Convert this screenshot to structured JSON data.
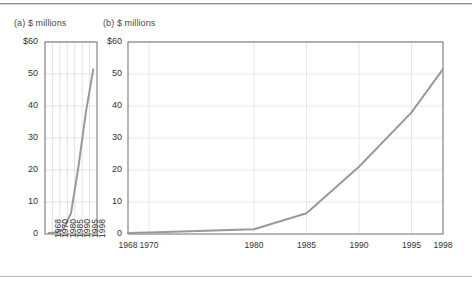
{
  "rules": {
    "top_label": "top-divider",
    "bottom_label": "bottom-divider"
  },
  "panels": [
    {
      "id": "a",
      "caption": "(a) $ millions"
    },
    {
      "id": "b",
      "caption": "(b) $ millions"
    }
  ],
  "chart_data": [
    {
      "type": "line",
      "title": "(a) $ millions",
      "xlabel": "",
      "ylabel": "$ millions",
      "x_scale": "categorical",
      "categories": [
        "1968",
        "1970",
        "1980",
        "1985",
        "1990",
        "1995",
        "1998"
      ],
      "values": [
        0.3,
        0.5,
        1.5,
        6.5,
        21,
        38,
        51.5
      ],
      "ytick_labels": [
        "$60",
        "50",
        "40",
        "30",
        "20",
        "10",
        "0"
      ],
      "yticks": [
        60,
        50,
        40,
        30,
        20,
        10,
        0
      ],
      "ylim": [
        0,
        60
      ],
      "grid": "both",
      "legend": "none",
      "series_color": "#999999"
    },
    {
      "type": "line",
      "title": "(b) $ millions",
      "xlabel": "",
      "ylabel": "$ millions",
      "x_scale": "linear",
      "x": [
        1968,
        1970,
        1980,
        1985,
        1990,
        1995,
        1998
      ],
      "xtick_labels": [
        "1968",
        "1970",
        "1980",
        "1985",
        "1990",
        "1995",
        "1998"
      ],
      "values": [
        0.3,
        0.5,
        1.5,
        6.5,
        21,
        38,
        51.5
      ],
      "ytick_labels": [
        "$60",
        "50",
        "40",
        "30",
        "20",
        "10",
        "0"
      ],
      "yticks": [
        60,
        50,
        40,
        30,
        20,
        10,
        0
      ],
      "xlim": [
        1968,
        1998
      ],
      "ylim": [
        0,
        60
      ],
      "grid": "both",
      "legend": "none",
      "series_color": "#999999"
    }
  ]
}
